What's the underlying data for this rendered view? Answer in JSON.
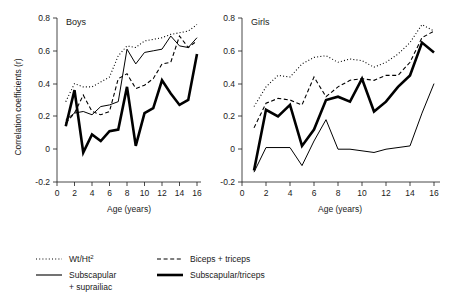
{
  "chart_data": {
    "type": "line",
    "title": "",
    "xlabel": "Age (years)",
    "ylabel": "Correlation coefficients (r)",
    "xlim": [
      0,
      16.5
    ],
    "ylim": [
      -0.2,
      0.8
    ],
    "xticks": [
      0,
      2,
      4,
      6,
      8,
      10,
      12,
      14,
      16
    ],
    "yticks": [
      -0.2,
      0,
      0.2,
      0.4,
      0.6,
      0.8
    ],
    "xtick_labels": [
      "0",
      "2",
      "4",
      "6",
      "8",
      "10",
      "12",
      "14",
      "16"
    ],
    "ytick_labels": [
      "-0.2",
      "0",
      "0.2",
      "0.4",
      "0.6",
      "0.8"
    ],
    "grid": false,
    "legend_position": "bottom",
    "panels": [
      {
        "name": "Boys",
        "x": [
          1,
          2,
          3,
          4,
          5,
          6,
          7,
          8,
          9,
          10,
          11,
          12,
          13,
          14,
          15,
          16
        ],
        "series": [
          {
            "name": "Wt/Ht2",
            "style": "dotted",
            "values": [
              0.29,
              0.4,
              0.38,
              0.38,
              0.41,
              0.44,
              0.57,
              0.63,
              0.62,
              0.66,
              0.67,
              0.68,
              0.7,
              0.71,
              0.72,
              0.76
            ]
          },
          {
            "name": "Biceps + triceps",
            "style": "dashed",
            "values": [
              0.16,
              0.22,
              0.33,
              0.23,
              0.21,
              0.23,
              0.43,
              0.46,
              0.37,
              0.39,
              0.43,
              0.52,
              0.53,
              0.69,
              0.62,
              0.66
            ]
          },
          {
            "name": "Subscapular + suprailiac",
            "style": "thin-solid",
            "values": [
              0.18,
              0.22,
              0.23,
              0.21,
              0.26,
              0.27,
              0.29,
              0.61,
              0.52,
              0.59,
              0.6,
              0.61,
              0.69,
              0.63,
              0.62,
              0.68
            ]
          },
          {
            "name": "Subscapular/triceps",
            "style": "thick-solid",
            "values": [
              0.14,
              0.36,
              -0.02,
              0.09,
              0.05,
              0.11,
              0.12,
              0.38,
              0.02,
              0.22,
              0.25,
              0.42,
              0.34,
              0.27,
              0.3,
              0.58
            ]
          }
        ]
      },
      {
        "name": "Girls",
        "x": [
          1,
          2,
          3,
          4,
          5,
          6,
          7,
          8,
          9,
          10,
          11,
          12,
          13,
          14,
          15,
          16
        ],
        "series": [
          {
            "name": "Wt/Ht2",
            "style": "dotted",
            "values": [
              0.26,
              0.38,
              0.45,
              0.44,
              0.52,
              0.56,
              0.57,
              0.53,
              0.55,
              0.54,
              0.5,
              0.53,
              0.58,
              0.65,
              0.76,
              0.72
            ]
          },
          {
            "name": "Biceps + triceps",
            "style": "dashed",
            "values": [
              0.13,
              0.28,
              0.31,
              0.3,
              0.27,
              0.44,
              0.32,
              0.38,
              0.42,
              0.43,
              0.42,
              0.45,
              0.45,
              0.53,
              0.68,
              0.72
            ]
          },
          {
            "name": "Subscapular + suprailiac",
            "style": "thin-solid",
            "values": [
              -0.14,
              0.01,
              0.01,
              0.01,
              -0.1,
              0.05,
              0.18,
              0.0,
              0.0,
              -0.01,
              -0.02,
              0.0,
              0.01,
              0.02,
              0.22,
              0.4
            ]
          },
          {
            "name": "Subscapular/triceps",
            "style": "thick-solid",
            "values": [
              -0.13,
              0.24,
              0.2,
              0.27,
              0.02,
              0.12,
              0.3,
              0.32,
              0.29,
              0.43,
              0.23,
              0.29,
              0.38,
              0.45,
              0.65,
              0.59
            ]
          }
        ]
      }
    ],
    "legend": [
      {
        "label": "Wt/Ht",
        "superscript": "2",
        "style": "dotted"
      },
      {
        "label": "Biceps + triceps",
        "superscript": "",
        "style": "dashed"
      },
      {
        "label": "Subscapular",
        "label2": "+ suprailiac",
        "superscript": "",
        "style": "thin-solid"
      },
      {
        "label": "Subscapular/triceps",
        "superscript": "",
        "style": "thick-solid"
      }
    ]
  },
  "colors": {
    "ink": "#1a1a1a",
    "line": "#000000",
    "background": "#ffffff"
  }
}
